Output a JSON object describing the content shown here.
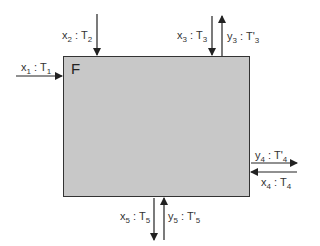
{
  "diagram": {
    "block": {
      "label": "F",
      "fill": "#c8c8c8",
      "border": "#333333"
    },
    "streams": [
      {
        "id": "x1",
        "var": "x",
        "sub": "1",
        "temp": "T",
        "tsub": "1",
        "prime": "",
        "direction": "in",
        "side": "left"
      },
      {
        "id": "x2",
        "var": "x",
        "sub": "2",
        "temp": "T",
        "tsub": "2",
        "prime": "",
        "direction": "in",
        "side": "top"
      },
      {
        "id": "x3",
        "var": "x",
        "sub": "3",
        "temp": "T",
        "tsub": "3",
        "prime": "",
        "direction": "in",
        "side": "top"
      },
      {
        "id": "y3",
        "var": "y",
        "sub": "3",
        "temp": "T",
        "tsub": "3",
        "prime": "'",
        "direction": "out",
        "side": "top"
      },
      {
        "id": "y4",
        "var": "y",
        "sub": "4",
        "temp": "T",
        "tsub": "4",
        "prime": "'",
        "direction": "out",
        "side": "right"
      },
      {
        "id": "x4",
        "var": "x",
        "sub": "4",
        "temp": "T",
        "tsub": "4",
        "prime": "",
        "direction": "in",
        "side": "right"
      },
      {
        "id": "x5",
        "var": "x",
        "sub": "5",
        "temp": "T",
        "tsub": "5",
        "prime": "",
        "direction": "out",
        "side": "bottom"
      },
      {
        "id": "y5",
        "var": "y",
        "sub": "5",
        "temp": "T",
        "tsub": "5",
        "prime": "'",
        "direction": "in",
        "side": "bottom"
      }
    ],
    "separator": " : "
  }
}
